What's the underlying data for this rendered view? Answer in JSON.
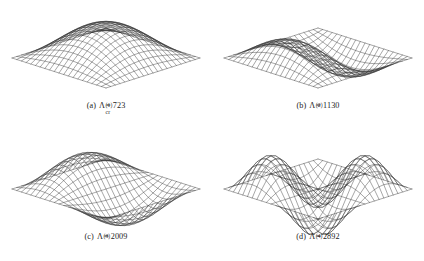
{
  "figure": {
    "background_color": "#ffffff",
    "line_color": "#2b2b2b",
    "subfigure_count": 4
  },
  "subfigures": [
    {
      "id": "a",
      "tag": "(a)",
      "symbol": "Λ",
      "superscript": "(1)",
      "subscript": "cr",
      "equals": "=",
      "value": "723",
      "caption_text": "(a)  Λcr(1) = 723",
      "mode": {
        "m": 1,
        "n": 1
      }
    },
    {
      "id": "b",
      "tag": "(b)",
      "symbol": "Λ",
      "superscript": "(2)",
      "subscript": "",
      "equals": "=",
      "value": "1130",
      "caption_text": "(b)  Λ(2) = 1130",
      "mode": {
        "m": 2,
        "n": 1
      }
    },
    {
      "id": "c",
      "tag": "(c)",
      "symbol": "Λ",
      "superscript": "(3)",
      "subscript": "",
      "equals": "=",
      "value": "2009",
      "caption_text": "(c)  Λ(3) = 2009",
      "mode": {
        "m": 1,
        "n": 2
      }
    },
    {
      "id": "d",
      "tag": "(d)",
      "symbol": "Λ",
      "superscript": "(4)",
      "subscript": "",
      "equals": "=",
      "value": "2892",
      "caption_text": "(d)  Λ(4) = 2892",
      "mode": {
        "m": 2,
        "n": 2
      }
    }
  ],
  "chart_data": {
    "type": "surface-mesh-grid",
    "grid": {
      "nu": 20,
      "nv": 20
    },
    "projection": {
      "type": "isometric-diamond",
      "half_width": 94,
      "half_depth": 30,
      "height_scale": 34,
      "center_x": 106,
      "center_y": 58
    },
    "panels": [
      {
        "label": "(a)",
        "eigenvalue_symbol": "Λ_cr^(1)",
        "eigenvalue": 723,
        "mode_m": 1,
        "mode_n": 1,
        "amplitude": 1.0,
        "shape_formula": "sin(m*pi*u)*sin(n*pi*v)",
        "peaks": 1,
        "troughs": 0
      },
      {
        "label": "(b)",
        "eigenvalue_symbol": "Λ^(2)",
        "eigenvalue": 1130,
        "mode_m": 2,
        "mode_n": 1,
        "amplitude": 0.72,
        "shape_formula": "sin(m*pi*u)*sin(n*pi*v)",
        "peaks": 1,
        "troughs": 1
      },
      {
        "label": "(c)",
        "eigenvalue_symbol": "Λ^(3)",
        "eigenvalue": 2009,
        "mode_m": 1,
        "mode_n": 2,
        "amplitude": 0.8,
        "shape_formula": "sin(m*pi*u)*sin(n*pi*v)",
        "peaks": 1,
        "troughs": 1
      },
      {
        "label": "(d)",
        "eigenvalue_symbol": "Λ^(4)",
        "eigenvalue": 2892,
        "mode_m": 2,
        "mode_n": 2,
        "amplitude": 0.98,
        "shape_formula": "sin(m*pi*u)*sin(n*pi*v)",
        "peaks": 2,
        "troughs": 2
      }
    ],
    "axis_visible": false,
    "grid_on": true,
    "legend": null,
    "xlabel": "",
    "ylabel": "",
    "zlabel": ""
  }
}
